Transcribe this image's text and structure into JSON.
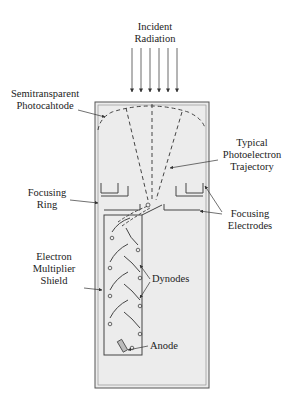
{
  "diagram": {
    "labels": {
      "incident_radiation": [
        "Incident",
        "Radiation"
      ],
      "photocathode": [
        "Semitransparent",
        "Photocahtode"
      ],
      "trajectory": [
        "Typical",
        "Photoelectron",
        "Trajectory"
      ],
      "focusing_ring": [
        "Focusing",
        "Ring"
      ],
      "focusing_electrodes": [
        "Focusing",
        "Electrodes"
      ],
      "shield": [
        "Electron",
        "Multiplier",
        "Shield"
      ],
      "dynodes": "Dynodes",
      "anode": "Anode"
    },
    "colors": {
      "tube_fill": "#ededed",
      "line": "#333333",
      "text": "#222222"
    }
  }
}
